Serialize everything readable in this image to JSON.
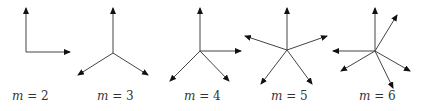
{
  "diagrams": [
    {
      "label_var": "m",
      "label_rest": " = 2",
      "origin": [
        26,
        52
      ],
      "vectors": [
        [
          26,
          8
        ],
        [
          70,
          52
        ]
      ],
      "label_x": 12
    },
    {
      "label_var": "m",
      "label_rest": " = 3",
      "origin": [
        113,
        53
      ],
      "vectors": [
        [
          113,
          8
        ],
        [
          78,
          75
        ],
        [
          148,
          75
        ]
      ],
      "label_x": 97
    },
    {
      "label_var": "m",
      "label_rest": " = 4",
      "origin": [
        200,
        51
      ],
      "vectors": [
        [
          200,
          8
        ],
        [
          241,
          51
        ],
        [
          170,
          81
        ],
        [
          229,
          81
        ]
      ],
      "label_x": 184
    },
    {
      "label_var": "m",
      "label_rest": " = 5",
      "origin": [
        287,
        50
      ],
      "vectors": [
        [
          287,
          8
        ],
        [
          245,
          36
        ],
        [
          327,
          36
        ],
        [
          261,
          84
        ],
        [
          312,
          84
        ]
      ],
      "label_x": 271
    },
    {
      "label_var": "m",
      "label_rest": " = 6",
      "origin": [
        375,
        51
      ],
      "vectors": [
        [
          375,
          8
        ],
        [
          397,
          15
        ],
        [
          333,
          51
        ],
        [
          341,
          71
        ],
        [
          410,
          71
        ],
        [
          393,
          88
        ]
      ],
      "label_x": 359
    }
  ],
  "colors": {
    "stroke": "#444444",
    "arrowhead": "#111111",
    "text": "#333333"
  }
}
